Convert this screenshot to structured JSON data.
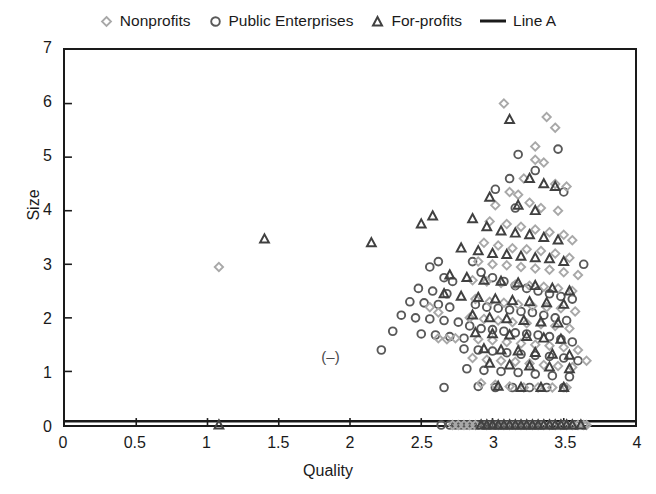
{
  "chart_data": {
    "type": "scatter",
    "title": "",
    "xlabel": "Quality",
    "ylabel": "Size",
    "xlim": [
      0,
      4
    ],
    "ylim": [
      0,
      7
    ],
    "xticks": [
      "0",
      "0.5",
      "1",
      "1.5",
      "2",
      "2.5",
      "3",
      "3.5",
      "4"
    ],
    "xtick_values": [
      0,
      0.5,
      1,
      1.5,
      2,
      2.5,
      3,
      3.5,
      4
    ],
    "yticks": [
      "0",
      "1",
      "2",
      "3",
      "4",
      "5",
      "6",
      "7"
    ],
    "ytick_values": [
      0,
      1,
      2,
      3,
      4,
      5,
      6,
      7
    ],
    "grid": false,
    "legend_position": "top-center",
    "annotations": [
      {
        "text": "(–)",
        "x": 1.85,
        "y": 1.35
      }
    ],
    "reference_line": {
      "name": "Line A",
      "orientation": "horizontal",
      "y": 0.07,
      "color": "#1a1a1a"
    },
    "series": [
      {
        "name": "Nonprofits",
        "marker": "diamond",
        "color": "#a8a8a8",
        "points": [
          [
            1.08,
            2.95
          ],
          [
            3.08,
            6.0
          ],
          [
            3.38,
            5.75
          ],
          [
            3.44,
            5.55
          ],
          [
            3.3,
            5.2
          ],
          [
            3.3,
            4.95
          ],
          [
            3.36,
            4.9
          ],
          [
            3.22,
            4.6
          ],
          [
            3.12,
            4.35
          ],
          [
            3.18,
            4.3
          ],
          [
            3.44,
            4.5
          ],
          [
            3.52,
            4.45
          ],
          [
            3.02,
            4.1
          ],
          [
            3.26,
            4.15
          ],
          [
            3.34,
            4.05
          ],
          [
            3.46,
            4.0
          ],
          [
            2.98,
            3.8
          ],
          [
            3.1,
            3.75
          ],
          [
            3.2,
            3.7
          ],
          [
            3.3,
            3.65
          ],
          [
            3.4,
            3.6
          ],
          [
            3.5,
            3.55
          ],
          [
            3.56,
            3.45
          ],
          [
            2.94,
            3.4
          ],
          [
            3.04,
            3.35
          ],
          [
            3.14,
            3.3
          ],
          [
            3.24,
            3.28
          ],
          [
            3.34,
            3.25
          ],
          [
            3.44,
            3.2
          ],
          [
            3.54,
            3.12
          ],
          [
            2.9,
            3.05
          ],
          [
            3.0,
            3.0
          ],
          [
            3.1,
            2.98
          ],
          [
            3.2,
            2.95
          ],
          [
            3.3,
            2.92
          ],
          [
            3.4,
            2.9
          ],
          [
            3.5,
            2.85
          ],
          [
            3.6,
            2.8
          ],
          [
            2.86,
            2.7
          ],
          [
            2.96,
            2.68
          ],
          [
            3.06,
            2.65
          ],
          [
            3.16,
            2.62
          ],
          [
            3.26,
            2.6
          ],
          [
            3.36,
            2.58
          ],
          [
            3.46,
            2.55
          ],
          [
            3.56,
            2.5
          ],
          [
            2.56,
            2.2
          ],
          [
            2.62,
            2.1
          ],
          [
            2.88,
            2.35
          ],
          [
            2.98,
            2.3
          ],
          [
            3.08,
            2.28
          ],
          [
            3.18,
            2.25
          ],
          [
            3.28,
            2.22
          ],
          [
            3.38,
            2.2
          ],
          [
            3.48,
            2.18
          ],
          [
            3.58,
            2.12
          ],
          [
            2.62,
            1.62
          ],
          [
            2.68,
            1.6
          ],
          [
            2.84,
            2.0
          ],
          [
            2.94,
            1.98
          ],
          [
            3.04,
            1.95
          ],
          [
            3.14,
            1.92
          ],
          [
            3.24,
            1.9
          ],
          [
            3.34,
            1.88
          ],
          [
            3.44,
            1.85
          ],
          [
            3.54,
            1.8
          ],
          [
            2.74,
            1.62
          ],
          [
            2.9,
            1.6
          ],
          [
            3.0,
            1.58
          ],
          [
            3.1,
            1.55
          ],
          [
            3.2,
            1.52
          ],
          [
            3.3,
            1.5
          ],
          [
            3.4,
            1.48
          ],
          [
            3.5,
            1.45
          ],
          [
            3.6,
            1.4
          ],
          [
            2.86,
            1.25
          ],
          [
            2.96,
            1.22
          ],
          [
            3.06,
            1.2
          ],
          [
            3.16,
            1.18
          ],
          [
            3.26,
            1.15
          ],
          [
            3.36,
            1.12
          ],
          [
            3.46,
            1.1
          ],
          [
            3.56,
            1.08
          ],
          [
            3.66,
            1.2
          ],
          [
            2.92,
            0.78
          ],
          [
            3.02,
            0.75
          ],
          [
            3.12,
            0.72
          ],
          [
            3.22,
            0.7
          ],
          [
            3.32,
            0.7
          ],
          [
            3.42,
            0.7
          ],
          [
            3.52,
            0.7
          ],
          [
            2.72,
            0.0
          ],
          [
            2.8,
            0.0
          ],
          [
            2.88,
            0.0
          ],
          [
            2.96,
            0.0
          ],
          [
            3.04,
            0.0
          ],
          [
            3.12,
            0.0
          ],
          [
            3.2,
            0.0
          ],
          [
            3.28,
            0.0
          ],
          [
            3.36,
            0.0
          ],
          [
            3.44,
            0.0
          ],
          [
            3.52,
            0.0
          ],
          [
            3.6,
            0.0
          ],
          [
            3.66,
            0.0
          ],
          [
            2.76,
            0.0
          ],
          [
            2.84,
            0.0
          ],
          [
            3.08,
            0.0
          ],
          [
            3.16,
            0.0
          ],
          [
            3.24,
            0.0
          ],
          [
            3.32,
            0.0
          ],
          [
            3.4,
            0.0
          ],
          [
            3.48,
            0.0
          ],
          [
            3.56,
            0.0
          ],
          [
            3.64,
            0.0
          ]
        ]
      },
      {
        "name": "Public Enterprises",
        "marker": "circle",
        "color": "#595959",
        "points": [
          [
            2.62,
            3.05
          ],
          [
            3.18,
            5.05
          ],
          [
            3.46,
            5.15
          ],
          [
            3.3,
            4.75
          ],
          [
            3.5,
            4.35
          ],
          [
            3.12,
            4.6
          ],
          [
            3.02,
            4.4
          ],
          [
            3.16,
            4.05
          ],
          [
            2.56,
            2.95
          ],
          [
            2.66,
            2.75
          ],
          [
            2.72,
            2.68
          ],
          [
            2.48,
            2.55
          ],
          [
            2.58,
            2.5
          ],
          [
            2.68,
            2.45
          ],
          [
            2.42,
            2.3
          ],
          [
            2.52,
            2.28
          ],
          [
            2.62,
            2.25
          ],
          [
            2.7,
            2.2
          ],
          [
            2.36,
            2.05
          ],
          [
            2.46,
            2.0
          ],
          [
            2.56,
            1.98
          ],
          [
            2.66,
            1.95
          ],
          [
            2.76,
            1.92
          ],
          [
            2.3,
            1.75
          ],
          [
            2.5,
            1.7
          ],
          [
            2.6,
            1.68
          ],
          [
            2.7,
            1.65
          ],
          [
            2.8,
            1.62
          ],
          [
            2.22,
            1.4
          ],
          [
            2.86,
            3.05
          ],
          [
            2.92,
            2.85
          ],
          [
            3.0,
            2.75
          ],
          [
            3.08,
            2.68
          ],
          [
            3.16,
            2.6
          ],
          [
            3.24,
            2.55
          ],
          [
            3.32,
            2.5
          ],
          [
            3.4,
            2.45
          ],
          [
            3.48,
            2.4
          ],
          [
            3.56,
            2.35
          ],
          [
            3.64,
            3.0
          ],
          [
            2.88,
            2.25
          ],
          [
            2.96,
            2.2
          ],
          [
            3.04,
            2.18
          ],
          [
            3.12,
            2.15
          ],
          [
            3.2,
            2.12
          ],
          [
            3.28,
            2.1
          ],
          [
            3.36,
            2.05
          ],
          [
            3.44,
            2.0
          ],
          [
            3.52,
            1.95
          ],
          [
            2.84,
            1.85
          ],
          [
            2.92,
            1.8
          ],
          [
            3.0,
            1.78
          ],
          [
            3.08,
            1.75
          ],
          [
            3.16,
            1.72
          ],
          [
            3.24,
            1.7
          ],
          [
            3.32,
            1.68
          ],
          [
            3.4,
            1.65
          ],
          [
            3.48,
            1.6
          ],
          [
            3.56,
            1.55
          ],
          [
            2.8,
            1.42
          ],
          [
            2.9,
            1.4
          ],
          [
            3.0,
            1.38
          ],
          [
            3.1,
            1.35
          ],
          [
            3.2,
            1.32
          ],
          [
            3.3,
            1.3
          ],
          [
            3.4,
            1.28
          ],
          [
            3.5,
            1.25
          ],
          [
            3.6,
            1.2
          ],
          [
            2.82,
            1.05
          ],
          [
            2.94,
            1.02
          ],
          [
            3.06,
            1.0
          ],
          [
            3.18,
            0.98
          ],
          [
            3.3,
            0.95
          ],
          [
            3.42,
            0.92
          ],
          [
            3.54,
            0.9
          ],
          [
            2.66,
            0.7
          ],
          [
            2.9,
            0.72
          ],
          [
            3.02,
            0.7
          ],
          [
            3.14,
            0.7
          ],
          [
            3.26,
            0.7
          ],
          [
            3.38,
            0.7
          ],
          [
            3.5,
            0.7
          ],
          [
            2.64,
            0.0
          ],
          [
            2.7,
            0.0
          ],
          [
            2.78,
            0.0
          ],
          [
            2.86,
            0.0
          ],
          [
            2.94,
            0.0
          ],
          [
            3.02,
            0.0
          ],
          [
            3.1,
            0.0
          ],
          [
            3.18,
            0.0
          ],
          [
            3.26,
            0.0
          ],
          [
            3.34,
            0.0
          ],
          [
            3.42,
            0.0
          ],
          [
            3.5,
            0.0
          ],
          [
            3.58,
            0.0
          ],
          [
            3.64,
            0.0
          ],
          [
            2.74,
            0.0
          ],
          [
            2.82,
            0.0
          ],
          [
            2.9,
            0.0
          ],
          [
            2.98,
            0.0
          ],
          [
            3.06,
            0.0
          ],
          [
            3.14,
            0.0
          ],
          [
            3.22,
            0.0
          ],
          [
            3.3,
            0.0
          ]
        ]
      },
      {
        "name": "For-profits",
        "marker": "triangle",
        "color": "#404040",
        "points": [
          [
            1.4,
            3.47
          ],
          [
            2.15,
            3.4
          ],
          [
            2.5,
            3.75
          ],
          [
            2.58,
            3.9
          ],
          [
            3.12,
            5.7
          ],
          [
            3.26,
            4.6
          ],
          [
            3.36,
            4.5
          ],
          [
            3.44,
            4.45
          ],
          [
            2.98,
            4.25
          ],
          [
            3.18,
            4.1
          ],
          [
            3.3,
            4.0
          ],
          [
            2.86,
            3.85
          ],
          [
            2.96,
            3.7
          ],
          [
            3.06,
            3.62
          ],
          [
            3.16,
            3.58
          ],
          [
            3.26,
            3.55
          ],
          [
            3.36,
            3.5
          ],
          [
            3.46,
            3.45
          ],
          [
            2.78,
            3.3
          ],
          [
            2.9,
            3.25
          ],
          [
            3.0,
            3.2
          ],
          [
            3.1,
            3.18
          ],
          [
            3.2,
            3.15
          ],
          [
            3.3,
            3.12
          ],
          [
            3.4,
            3.1
          ],
          [
            3.5,
            3.05
          ],
          [
            2.7,
            2.8
          ],
          [
            2.82,
            2.75
          ],
          [
            2.94,
            2.7
          ],
          [
            3.06,
            2.68
          ],
          [
            3.18,
            2.65
          ],
          [
            3.3,
            2.6
          ],
          [
            3.42,
            2.55
          ],
          [
            3.54,
            2.5
          ],
          [
            2.66,
            2.45
          ],
          [
            2.78,
            2.4
          ],
          [
            2.9,
            2.38
          ],
          [
            3.02,
            2.35
          ],
          [
            3.14,
            2.32
          ],
          [
            3.26,
            2.3
          ],
          [
            3.38,
            2.28
          ],
          [
            3.5,
            2.25
          ],
          [
            2.86,
            2.05
          ],
          [
            2.98,
            2.0
          ],
          [
            3.1,
            1.98
          ],
          [
            3.22,
            1.95
          ],
          [
            3.34,
            1.92
          ],
          [
            3.46,
            1.9
          ],
          [
            2.88,
            1.72
          ],
          [
            3.0,
            1.7
          ],
          [
            3.12,
            1.68
          ],
          [
            3.24,
            1.65
          ],
          [
            3.36,
            1.62
          ],
          [
            3.48,
            1.6
          ],
          [
            2.94,
            1.42
          ],
          [
            3.06,
            1.4
          ],
          [
            3.18,
            1.38
          ],
          [
            3.3,
            1.35
          ],
          [
            3.42,
            1.32
          ],
          [
            3.54,
            1.3
          ],
          [
            2.98,
            1.15
          ],
          [
            3.12,
            1.12
          ],
          [
            3.26,
            1.1
          ],
          [
            3.4,
            1.08
          ],
          [
            3.54,
            1.05
          ],
          [
            3.04,
            0.72
          ],
          [
            3.2,
            0.7
          ],
          [
            3.34,
            0.7
          ],
          [
            3.5,
            0.7
          ],
          [
            1.08,
            0.0
          ],
          [
            2.92,
            0.0
          ],
          [
            3.0,
            0.0
          ],
          [
            3.08,
            0.0
          ],
          [
            3.16,
            0.0
          ],
          [
            3.24,
            0.0
          ],
          [
            3.32,
            0.0
          ],
          [
            3.4,
            0.0
          ],
          [
            3.48,
            0.0
          ],
          [
            3.56,
            0.0
          ],
          [
            3.62,
            0.0
          ],
          [
            2.96,
            0.0
          ],
          [
            3.04,
            0.0
          ],
          [
            3.12,
            0.0
          ],
          [
            3.2,
            0.0
          ],
          [
            3.28,
            0.0
          ],
          [
            3.36,
            0.0
          ],
          [
            3.44,
            0.0
          ],
          [
            3.52,
            0.0
          ]
        ]
      }
    ]
  },
  "legend": {
    "items": [
      {
        "label": "Nonprofits",
        "marker": "diamond-marker",
        "color": "#a8a8a8"
      },
      {
        "label": "Public Enterprises",
        "marker": "circle-marker",
        "color": "#595959"
      },
      {
        "label": "For-profits",
        "marker": "triangle-marker",
        "color": "#404040"
      },
      {
        "label": "Line A",
        "marker": "line-marker",
        "color": "#1a1a1a"
      }
    ]
  }
}
